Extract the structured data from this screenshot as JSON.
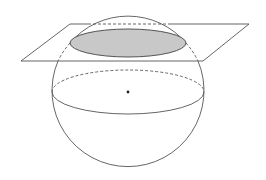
{
  "diagram": {
    "colors": {
      "background": "#ffffff",
      "stroke": "#555555",
      "cross_section_fill": "#c8c8c8",
      "center_point": "#222222"
    },
    "sphere": {
      "cx": 128,
      "cy": 92,
      "r": 76
    },
    "equator": {
      "cx": 128,
      "cy": 92,
      "rx": 76,
      "ry": 22
    },
    "cross_section": {
      "cx": 128,
      "cy": 43,
      "rx": 58,
      "ry": 14
    },
    "plane": {
      "points": [
        [
          70,
          24
        ],
        [
          249,
          24
        ],
        [
          203,
          61
        ],
        [
          21,
          61
        ]
      ]
    },
    "center_point": {
      "x": 128,
      "y": 92,
      "r": 1.4
    }
  }
}
